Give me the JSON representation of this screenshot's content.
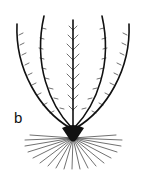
{
  "figure": {
    "panel_label": "b",
    "arms": 5,
    "line_color": "#111111",
    "background": "#ffffff"
  }
}
